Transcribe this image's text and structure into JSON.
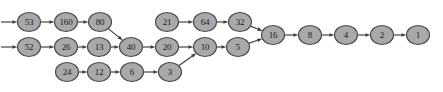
{
  "diagram": {
    "background_color": "#ffffff",
    "node_fill": "#a9a9a9",
    "node_stroke": "#4a4a4a",
    "edge_color": "#3c3c3c",
    "label_color": "#1a1a1a",
    "node_rx": 11.5,
    "node_ry": 9.5,
    "nodes": [
      {
        "id": "n53",
        "label": "53",
        "cx": 29,
        "cy": 22
      },
      {
        "id": "n160",
        "label": "160",
        "cx": 66,
        "cy": 22
      },
      {
        "id": "n80",
        "label": "80",
        "cx": 100,
        "cy": 22
      },
      {
        "id": "n21",
        "label": "21",
        "cx": 167,
        "cy": 22
      },
      {
        "id": "n64",
        "label": "64",
        "cx": 205,
        "cy": 22
      },
      {
        "id": "n32",
        "label": "32",
        "cx": 240,
        "cy": 22
      },
      {
        "id": "n52",
        "label": "52",
        "cx": 29,
        "cy": 47
      },
      {
        "id": "n26",
        "label": "26",
        "cx": 66,
        "cy": 47
      },
      {
        "id": "n13",
        "label": "13",
        "cx": 99,
        "cy": 47
      },
      {
        "id": "n40",
        "label": "40",
        "cx": 131,
        "cy": 47
      },
      {
        "id": "n20",
        "label": "20",
        "cx": 167,
        "cy": 47
      },
      {
        "id": "n10",
        "label": "10",
        "cx": 205,
        "cy": 47
      },
      {
        "id": "n5",
        "label": "5",
        "cx": 238,
        "cy": 47
      },
      {
        "id": "n24",
        "label": "24",
        "cx": 67,
        "cy": 72
      },
      {
        "id": "n12",
        "label": "12",
        "cx": 99,
        "cy": 72
      },
      {
        "id": "n6",
        "label": "6",
        "cx": 132,
        "cy": 72
      },
      {
        "id": "n3",
        "label": "3",
        "cx": 170,
        "cy": 72
      },
      {
        "id": "n16",
        "label": "16",
        "cx": 273,
        "cy": 35
      },
      {
        "id": "n8",
        "label": "8",
        "cx": 310,
        "cy": 35
      },
      {
        "id": "n4",
        "label": "4",
        "cx": 346,
        "cy": 35
      },
      {
        "id": "n2",
        "label": "2",
        "cx": 382,
        "cy": 35
      },
      {
        "id": "n1",
        "label": "1",
        "cx": 418,
        "cy": 35
      }
    ],
    "entry_arrows": [
      {
        "id": "entry-top",
        "x1": 1,
        "y1": 22,
        "x2": 29,
        "y2": 22
      },
      {
        "id": "entry-middle",
        "x1": 1,
        "y1": 47,
        "x2": 29,
        "y2": 47
      }
    ],
    "edges": [
      {
        "id": "e-53-160",
        "from": "n53",
        "to": "n160"
      },
      {
        "id": "e-160-80",
        "from": "n160",
        "to": "n80"
      },
      {
        "id": "e-80-40",
        "from": "n80",
        "to": "n40"
      },
      {
        "id": "e-52-26",
        "from": "n52",
        "to": "n26"
      },
      {
        "id": "e-26-13",
        "from": "n26",
        "to": "n13"
      },
      {
        "id": "e-13-40",
        "from": "n13",
        "to": "n40"
      },
      {
        "id": "e-40-20",
        "from": "n40",
        "to": "n20"
      },
      {
        "id": "e-20-10",
        "from": "n20",
        "to": "n10"
      },
      {
        "id": "e-10-5",
        "from": "n10",
        "to": "n5"
      },
      {
        "id": "e-5-16",
        "from": "n5",
        "to": "n16"
      },
      {
        "id": "e-24-12",
        "from": "n24",
        "to": "n12"
      },
      {
        "id": "e-12-6",
        "from": "n12",
        "to": "n6"
      },
      {
        "id": "e-6-3",
        "from": "n6",
        "to": "n3"
      },
      {
        "id": "e-3-10",
        "from": "n3",
        "to": "n10"
      },
      {
        "id": "e-21-64",
        "from": "n21",
        "to": "n64"
      },
      {
        "id": "e-64-32",
        "from": "n64",
        "to": "n32"
      },
      {
        "id": "e-32-16",
        "from": "n32",
        "to": "n16"
      },
      {
        "id": "e-16-8",
        "from": "n16",
        "to": "n8"
      },
      {
        "id": "e-8-4",
        "from": "n8",
        "to": "n4"
      },
      {
        "id": "e-4-2",
        "from": "n4",
        "to": "n2"
      },
      {
        "id": "e-2-1",
        "from": "n2",
        "to": "n1"
      }
    ]
  }
}
